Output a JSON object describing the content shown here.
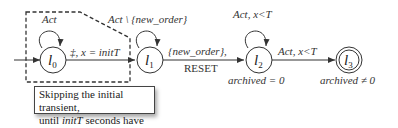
{
  "diagram": {
    "states": [
      {
        "id": "l0",
        "name": "l",
        "sub": "0",
        "self_loop": "Act",
        "initial": true
      },
      {
        "id": "l1",
        "name": "l",
        "sub": "1",
        "self_loop": "Act \\ {new_order}"
      },
      {
        "id": "l2",
        "name": "l",
        "sub": "2",
        "self_loop": "Act, x<T",
        "annotation": "archived = 0"
      },
      {
        "id": "l3",
        "name": "l",
        "sub": "3",
        "accepting": true,
        "annotation": "archived ≠ 0"
      }
    ],
    "transitions": [
      {
        "from": "l0",
        "to": "l1",
        "label": "‡, x = initT"
      },
      {
        "from": "l1",
        "to": "l2",
        "label_top": "{new_order},",
        "label_bottom": "RESET"
      },
      {
        "from": "l2",
        "to": "l3",
        "label": "Act, x<T"
      }
    ],
    "note": {
      "line1": "Skipping the initial transient,",
      "line2_em": "initT",
      "line2_pre": "until ",
      "line2_post": " seconds have passed."
    }
  }
}
